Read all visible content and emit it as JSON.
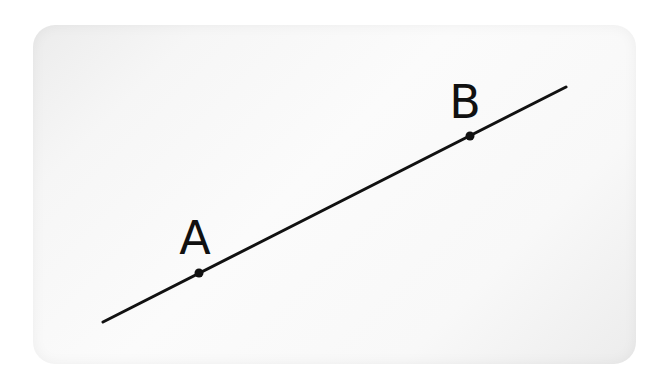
{
  "figure": {
    "type": "line-segment-with-points",
    "line": {
      "x1": 103,
      "y1": 322,
      "x2": 566,
      "y2": 87,
      "color": "#111111",
      "width": 3
    },
    "points": [
      {
        "label": "A",
        "x": 199,
        "y": 273,
        "label_x": 195,
        "label_y": 254
      },
      {
        "label": "B",
        "x": 470,
        "y": 136,
        "label_x": 465,
        "label_y": 118
      }
    ],
    "background": "#f6f6f6"
  }
}
